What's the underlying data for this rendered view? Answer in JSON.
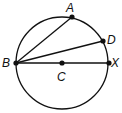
{
  "diagram": {
    "type": "geometry-circle",
    "circle": {
      "center": "C",
      "cx": 62,
      "cy": 63,
      "r": 46
    },
    "points": [
      {
        "name": "A",
        "x": 72,
        "y": 17,
        "label": "A",
        "lx": 66,
        "ly": 12
      },
      {
        "name": "D",
        "x": 103,
        "y": 41,
        "label": "D",
        "lx": 108,
        "ly": 44
      },
      {
        "name": "B",
        "x": 16,
        "y": 63,
        "label": "B",
        "lx": 2,
        "ly": 67
      },
      {
        "name": "C",
        "x": 62,
        "y": 63,
        "label": "C",
        "lx": 57,
        "ly": 80
      },
      {
        "name": "X",
        "x": 109,
        "y": 63,
        "label": "X",
        "lx": 112,
        "ly": 67
      }
    ],
    "segments": [
      {
        "from": "B",
        "to": "A"
      },
      {
        "from": "B",
        "to": "D"
      },
      {
        "from": "B",
        "to": "X"
      }
    ],
    "stroke_color": "#111111"
  }
}
